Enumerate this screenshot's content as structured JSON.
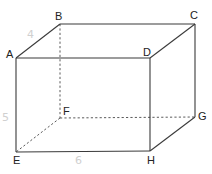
{
  "diagram": {
    "type": "rectangular-prism",
    "vertices": [
      {
        "name": "A",
        "x": 16,
        "y": 58,
        "lx": 6,
        "ly": 58
      },
      {
        "name": "B",
        "x": 60,
        "y": 24,
        "lx": 55,
        "ly": 20
      },
      {
        "name": "C",
        "x": 195,
        "y": 24,
        "lx": 190,
        "ly": 19
      },
      {
        "name": "D",
        "x": 150,
        "y": 58,
        "lx": 143,
        "ly": 56
      },
      {
        "name": "E",
        "x": 16,
        "y": 152,
        "lx": 13,
        "ly": 164
      },
      {
        "name": "F",
        "x": 60,
        "y": 118,
        "lx": 63,
        "ly": 115
      },
      {
        "name": "G",
        "x": 195,
        "y": 117,
        "lx": 198,
        "ly": 120
      },
      {
        "name": "H",
        "x": 150,
        "y": 151,
        "lx": 147,
        "ly": 164
      }
    ],
    "visible_edges": [
      [
        "A",
        "B"
      ],
      [
        "B",
        "C"
      ],
      [
        "C",
        "D"
      ],
      [
        "D",
        "A"
      ],
      [
        "A",
        "E"
      ],
      [
        "D",
        "H"
      ],
      [
        "C",
        "G"
      ],
      [
        "E",
        "H"
      ],
      [
        "H",
        "G"
      ]
    ],
    "hidden_edges": [
      [
        "B",
        "F"
      ],
      [
        "F",
        "E"
      ],
      [
        "F",
        "G"
      ]
    ],
    "dimension_labels": [
      {
        "text": "4",
        "x": 27,
        "y": 38
      },
      {
        "text": "5",
        "x": 2,
        "y": 121
      },
      {
        "text": "6",
        "x": 75,
        "y": 164
      }
    ],
    "colors": {
      "edge": "#3a3a3a",
      "hidden_edge": "#5a5a5a",
      "label": "#222222",
      "dimension": "#d0d0d0"
    }
  }
}
